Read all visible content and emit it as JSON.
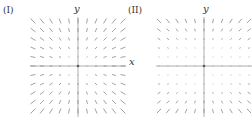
{
  "figure": {
    "panels": [
      {
        "label": "(I)",
        "y_axis_label": "y",
        "x_axis_label": "x",
        "field": "radial",
        "description": "vector field F(x,y) = (x, y)"
      },
      {
        "label": "(II)",
        "y_axis_label": "y",
        "x_axis_label": "",
        "field": "y-scaled radial",
        "description": "vector field F(x,y) = y·(x, y)"
      }
    ],
    "grid_points_per_axis": 11,
    "domain": [
      -5,
      5
    ],
    "vector_color": "#8a8a8a",
    "axis_color": "#999999"
  }
}
